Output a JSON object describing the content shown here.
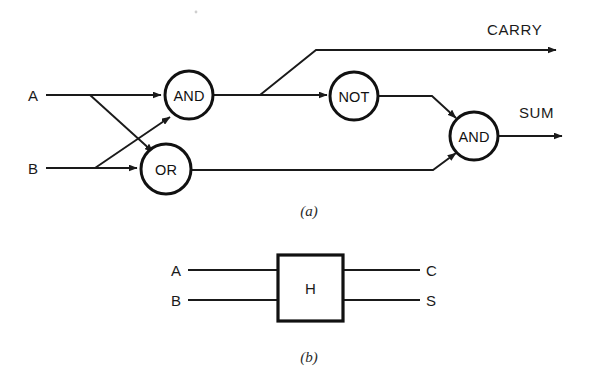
{
  "figure": {
    "colors": {
      "ink": "#111111",
      "wire": "#1a1a1a",
      "background": "#ffffff"
    },
    "panel_a": {
      "caption": "(a)",
      "inputs": [
        {
          "label": "A",
          "x": 30,
          "y": 95
        },
        {
          "label": "B",
          "x": 30,
          "y": 168
        }
      ],
      "gates": [
        {
          "label": "AND",
          "cx": 189,
          "cy": 95,
          "r": 24
        },
        {
          "label": "OR",
          "cx": 166,
          "cy": 169,
          "r": 25
        },
        {
          "label": "NOT",
          "cx": 354,
          "cy": 96,
          "r": 24
        },
        {
          "label": "AND",
          "cx": 474,
          "cy": 136,
          "r": 24
        }
      ],
      "outputs": [
        {
          "label": "CARRY",
          "x": 487,
          "y": 29
        },
        {
          "label": "SUM",
          "x": 519,
          "y": 112
        }
      ]
    },
    "panel_b": {
      "caption": "(b)",
      "block_label": "H",
      "inputs": [
        {
          "label": "A",
          "y": 270
        },
        {
          "label": "B",
          "y": 300
        }
      ],
      "outputs": [
        {
          "label": "C",
          "y": 270
        },
        {
          "label": "S",
          "y": 300
        }
      ]
    }
  }
}
